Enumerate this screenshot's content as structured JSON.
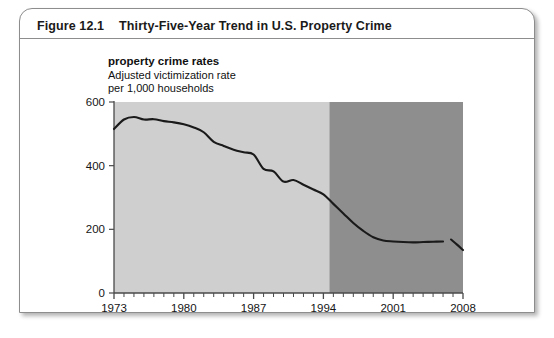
{
  "figure": {
    "number": "Figure 12.1",
    "title": "Thirty-Five-Year Trend in U.S. Property Crime"
  },
  "caption": {
    "heading": "property crime rates",
    "line2": "Adjusted victimization rate",
    "line3": "per 1,000 households"
  },
  "colors": {
    "band_early": "#cfcfcf",
    "band_late": "#8e8e8e",
    "line": "#1a1a1a",
    "axis": "#4a4a4a",
    "card_border": "#8d8d8d",
    "text": "#1a1a1a"
  },
  "chart_data": {
    "type": "line",
    "title": "Thirty-Five-Year Trend in U.S. Property Crime",
    "subtitle": "property crime rates",
    "xlabel": "",
    "ylabel": "Adjusted victimization rate per 1,000 households",
    "xlim": [
      1973,
      2008
    ],
    "ylim": [
      0,
      600
    ],
    "yticks": [
      0,
      200,
      400,
      600
    ],
    "ytick_labels": [
      "0",
      "200",
      "400",
      "600"
    ],
    "xticks": [
      1973,
      1980,
      1987,
      1994,
      2001,
      2008
    ],
    "xtick_labels": [
      "1973",
      "1980",
      "1987",
      "1994",
      "2001",
      "2008"
    ],
    "minor_xtick_interval": 1,
    "grid": false,
    "legend": null,
    "shaded_bands": [
      {
        "name": "early-period-band",
        "x_start": 1973,
        "x_end": 1994.6,
        "color": "#cfcfcf"
      },
      {
        "name": "late-period-band",
        "x_start": 1994.6,
        "x_end": 2008,
        "color": "#8e8e8e"
      }
    ],
    "series": [
      {
        "name": "Property crime rate",
        "color": "#1a1a1a",
        "x": [
          1973,
          1974,
          1975,
          1976,
          1977,
          1978,
          1979,
          1980,
          1981,
          1982,
          1983,
          1984,
          1985,
          1986,
          1987,
          1988,
          1989,
          1990,
          1991,
          1992,
          1993,
          1994,
          1995,
          1996,
          1997,
          1998,
          1999,
          2000,
          2001,
          2002,
          2003,
          2004,
          2005,
          2006
        ],
        "values": [
          515,
          545,
          553,
          545,
          546,
          540,
          536,
          530,
          520,
          505,
          475,
          462,
          450,
          442,
          435,
          390,
          382,
          350,
          355,
          340,
          325,
          310,
          280,
          250,
          220,
          195,
          175,
          165,
          162,
          160,
          159,
          160,
          161,
          162
        ]
      },
      {
        "name": "Property crime rate (post-break)",
        "color": "#1a1a1a",
        "x": [
          2006.8,
          2007.4,
          2008
        ],
        "values": [
          168,
          152,
          135
        ]
      }
    ]
  }
}
